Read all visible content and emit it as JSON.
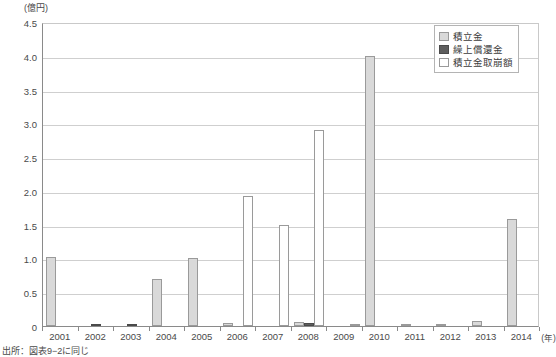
{
  "chart_data": {
    "type": "bar",
    "title": "",
    "xlabel": "(年)",
    "ylabel": "(億円)",
    "ylim": [
      0,
      4.5
    ],
    "ytick_step": 0.5,
    "yticks": [
      "4.5",
      "4.0",
      "3.5",
      "3.0",
      "2.5",
      "2.0",
      "1.5",
      "1.0",
      "0.5",
      "0"
    ],
    "ytick_values": [
      4.5,
      4.0,
      3.5,
      3.0,
      2.5,
      2.0,
      1.5,
      1.0,
      0.5,
      0
    ],
    "grid": true,
    "legend_position": "top-right",
    "categories": [
      "2001",
      "2002",
      "2003",
      "2004",
      "2005",
      "2006",
      "2007",
      "2008",
      "2009",
      "2010",
      "2011",
      "2012",
      "2013",
      "2014"
    ],
    "series": [
      {
        "name": "積立金",
        "color": "#d9d9d9",
        "values": [
          1.02,
          0.0,
          0.0,
          0.7,
          1.0,
          0.05,
          0.0,
          0.06,
          0.0,
          4.0,
          0.03,
          0.03,
          0.07,
          1.58
        ]
      },
      {
        "name": "繰上償還金",
        "color": "#5e5e5e",
        "values": [
          0.0,
          0.02,
          0.01,
          0.0,
          0.0,
          0.0,
          0.0,
          0.05,
          0.0,
          0.0,
          0.0,
          0.0,
          0.0,
          0.0
        ]
      },
      {
        "name": "積立金取崩額",
        "color": "#ffffff",
        "values": [
          0.0,
          0.0,
          0.0,
          0.0,
          0.0,
          1.92,
          1.5,
          2.9,
          0.02,
          0.0,
          0.0,
          0.0,
          0.0,
          0.0
        ]
      }
    ]
  },
  "legend": {
    "items": [
      {
        "label": "積立金",
        "swatch": "series-tsumitate"
      },
      {
        "label": "繰上償還金",
        "swatch": "series-kuriage"
      },
      {
        "label": "積立金取崩額",
        "swatch": "series-torikuzushi"
      }
    ]
  },
  "axis": {
    "y_unit": "(億円)",
    "x_unit": "(年)"
  },
  "source": {
    "text": "出所：図表9−2に同じ"
  }
}
